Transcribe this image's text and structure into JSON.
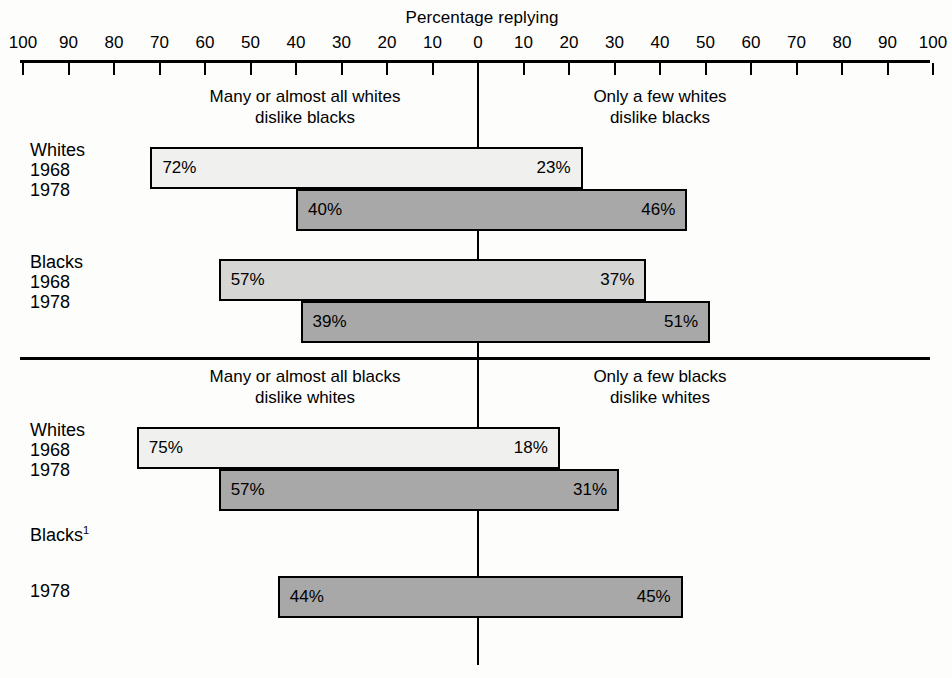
{
  "axis": {
    "title": "Percentage replying",
    "tick_labels_left": [
      "100",
      "90",
      "80",
      "70",
      "60",
      "50",
      "40",
      "30",
      "20",
      "10"
    ],
    "tick_labels_right": [
      "10",
      "20",
      "30",
      "40",
      "50",
      "60",
      "70",
      "80",
      "90",
      "100"
    ],
    "zero_label": "0",
    "min": 0,
    "max": 100,
    "step": 10
  },
  "sections": [
    {
      "id": "whites-disliked",
      "left_heading_line1": "Many or almost all whites",
      "left_heading_line2": "dislike blacks",
      "right_heading_line1": "Only a few whites",
      "right_heading_line2": "dislike blacks",
      "groups": [
        {
          "label": "Whites",
          "rows": [
            {
              "year": "1968",
              "left_value": 72,
              "right_value": 23,
              "left_text": "72%",
              "right_text": "23%",
              "shade": "light"
            },
            {
              "year": "1978",
              "left_value": 40,
              "right_value": 46,
              "left_text": "40%",
              "right_text": "46%",
              "shade": "dark"
            }
          ]
        },
        {
          "label": "Blacks",
          "rows": [
            {
              "year": "1968",
              "left_value": 57,
              "right_value": 37,
              "left_text": "57%",
              "right_text": "37%",
              "shade": "mid"
            },
            {
              "year": "1978",
              "left_value": 39,
              "right_value": 51,
              "left_text": "39%",
              "right_text": "51%",
              "shade": "dark"
            }
          ]
        }
      ]
    },
    {
      "id": "blacks-disliked",
      "left_heading_line1": "Many or almost all blacks",
      "left_heading_line2": "dislike whites",
      "right_heading_line1": "Only a few blacks",
      "right_heading_line2": "dislike whites",
      "groups": [
        {
          "label": "Whites",
          "rows": [
            {
              "year": "1968",
              "left_value": 75,
              "right_value": 18,
              "left_text": "75%",
              "right_text": "18%",
              "shade": "light"
            },
            {
              "year": "1978",
              "left_value": 57,
              "right_value": 31,
              "left_text": "57%",
              "right_text": "31%",
              "shade": "dark"
            }
          ]
        },
        {
          "label": "Blacks",
          "label_footnote": "1",
          "rows": [
            {
              "year": "1978",
              "left_value": 44,
              "right_value": 45,
              "left_text": "44%",
              "right_text": "45%",
              "shade": "dark"
            }
          ]
        }
      ]
    }
  ],
  "chart_data": {
    "type": "bar",
    "title": "Percentage replying",
    "subtype": "diverging-horizontal-bar",
    "xlabel": "Percentage replying",
    "ylabel": "",
    "xlim": [
      -100,
      100
    ],
    "grid": false,
    "legend": "none",
    "axis_note": "Axis is mirrored: values increase outward from 0 at center to 100 on both sides",
    "panels": [
      {
        "name": "Whites dislike blacks",
        "left_category": "Many or almost all whites dislike blacks",
        "right_category": "Only a few whites dislike blacks",
        "rows": [
          {
            "respondent": "Whites",
            "year": 1968,
            "left": 72,
            "right": 23
          },
          {
            "respondent": "Whites",
            "year": 1978,
            "left": 40,
            "right": 46
          },
          {
            "respondent": "Blacks",
            "year": 1968,
            "left": 57,
            "right": 37
          },
          {
            "respondent": "Blacks",
            "year": 1978,
            "left": 39,
            "right": 51
          }
        ]
      },
      {
        "name": "Blacks dislike whites",
        "left_category": "Many or almost all blacks dislike whites",
        "right_category": "Only a few blacks dislike whites",
        "rows": [
          {
            "respondent": "Whites",
            "year": 1968,
            "left": 75,
            "right": 18
          },
          {
            "respondent": "Whites",
            "year": 1978,
            "left": 57,
            "right": 31
          },
          {
            "respondent": "Blacks",
            "year": 1978,
            "left": 44,
            "right": 45,
            "footnote": "1"
          }
        ]
      }
    ]
  }
}
